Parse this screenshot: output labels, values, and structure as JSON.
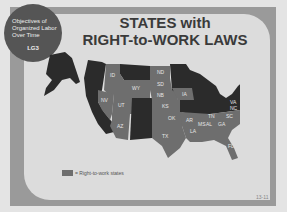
{
  "badge": {
    "lines": [
      "Objectives of",
      "Organized Labor",
      "Over Time"
    ],
    "code": "LG3"
  },
  "title": {
    "line1": "STATES with",
    "line2": "RIGHT-to-WORK LAWS"
  },
  "legend": {
    "label": "= Right-to-work states",
    "color": "#6e6e6e"
  },
  "colors": {
    "right_to_work": "#6e6e6e",
    "other": "#2b2b2b",
    "background": "#dcdcdc"
  },
  "map": {
    "right_to_work_states": [
      "ID",
      "WY",
      "NV",
      "UT",
      "AZ",
      "ND",
      "SD",
      "NE",
      "KS",
      "IA",
      "OK",
      "TX",
      "AR",
      "LA",
      "MS",
      "AL",
      "TN",
      "GA",
      "SC",
      "NC",
      "VA",
      "FL"
    ],
    "labels": {
      "ID": "ID",
      "WY": "WY",
      "NV": "NV",
      "UT": "UT",
      "AZ": "AZ",
      "ND": "ND",
      "SD": "SD",
      "NB": "NB",
      "KS": "KS",
      "IA": "IA",
      "OK": "OK",
      "TX": "TX",
      "AR": "AR",
      "LA": "LA",
      "MS": "MS",
      "AL": "AL",
      "TN": "TN",
      "GA": "GA",
      "SC": "SC",
      "NC": "NC",
      "VA": "VA",
      "FL": "FL"
    }
  },
  "page_number": "13-11"
}
